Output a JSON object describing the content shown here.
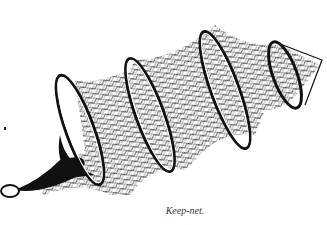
{
  "figure": {
    "caption": "Keep-net.",
    "ink_color": "#111111",
    "background_color": "#ffffff"
  }
}
